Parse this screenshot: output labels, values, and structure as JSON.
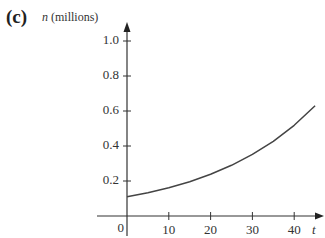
{
  "chart_data": {
    "type": "line",
    "panel_label": "(c)",
    "title": "",
    "xlabel": "t",
    "ylabel_var": "n",
    "ylabel_unit": "(millions)",
    "xlim": [
      0,
      47
    ],
    "ylim": [
      0,
      1.1
    ],
    "x_ticks": [
      10,
      20,
      30,
      40
    ],
    "x_tick_labels": [
      "10",
      "20",
      "30",
      "40"
    ],
    "y_ticks": [
      0.2,
      0.4,
      0.6,
      0.8,
      1.0
    ],
    "y_tick_labels": [
      "0.2",
      "0.4",
      "0.6",
      "0.8",
      "1.0"
    ],
    "origin_label": "0",
    "grid": false,
    "legend": null,
    "series": [
      {
        "name": "n(t)",
        "x": [
          0,
          5,
          10,
          15,
          20,
          25,
          30,
          35,
          40,
          45
        ],
        "y": [
          0.11,
          0.133,
          0.162,
          0.196,
          0.238,
          0.29,
          0.352,
          0.427,
          0.518,
          0.63
        ]
      }
    ]
  }
}
